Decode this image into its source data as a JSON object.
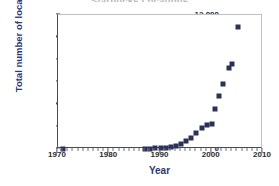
{
  "chart_data": {
    "type": "scatter",
    "title": "Starbucks Locations",
    "xlabel": "Year",
    "ylabel": "Total number of locations",
    "xlim": [
      1970,
      2010
    ],
    "ylim": [
      0,
      12000
    ],
    "grid": false,
    "legend": null,
    "marker": {
      "shape": "square",
      "color": "#2b3158",
      "size": 5
    },
    "xticks": [
      1970,
      1980,
      1990,
      2000,
      2010
    ],
    "xtick_labels": [
      "1970",
      "1980",
      "1990",
      "2000",
      "2010"
    ],
    "xtick_minor_step": 1,
    "yticks": [
      0,
      2000,
      4000,
      6000,
      8000,
      10000,
      12000
    ],
    "ytick_labels": [
      "0",
      "2000",
      "4000",
      "6000",
      "8000",
      "10,000",
      "12,000"
    ],
    "x": [
      1971,
      1987,
      1988,
      1989,
      1990,
      1991,
      1992,
      1993,
      1994,
      1995,
      1996,
      1997,
      1998,
      1999,
      2000,
      2001,
      2002,
      2003,
      2004,
      2005
    ],
    "values": [
      1,
      17,
      33,
      55,
      84,
      116,
      165,
      272,
      425,
      677,
      1015,
      1412,
      1886,
      2135,
      2250,
      3500,
      4750,
      5800,
      7250,
      7650
    ],
    "points": [
      {
        "x": 1971,
        "y": 1
      },
      {
        "x": 1987,
        "y": 17
      },
      {
        "x": 1988,
        "y": 33
      },
      {
        "x": 1989,
        "y": 55
      },
      {
        "x": 1990,
        "y": 84
      },
      {
        "x": 1991,
        "y": 116
      },
      {
        "x": 1992,
        "y": 165
      },
      {
        "x": 1993,
        "y": 272
      },
      {
        "x": 1994,
        "y": 425
      },
      {
        "x": 1995,
        "y": 677
      },
      {
        "x": 1996,
        "y": 1015
      },
      {
        "x": 1997,
        "y": 1412
      },
      {
        "x": 1998,
        "y": 1886
      },
      {
        "x": 1999,
        "y": 2135
      },
      {
        "x": 2000,
        "y": 2250
      },
      {
        "x": 2000.6,
        "y": 3550
      },
      {
        "x": 2001.4,
        "y": 4750
      },
      {
        "x": 2002.2,
        "y": 5800
      },
      {
        "x": 2003.3,
        "y": 7250
      },
      {
        "x": 2003.9,
        "y": 7650
      },
      {
        "x": 2005.2,
        "y": 10900
      }
    ]
  },
  "colors": {
    "marker": "#2b3158",
    "axis_title": "#283a72",
    "tick_label": "#2a2a30",
    "axis_line": "#4a4a52",
    "background": "#ffffff"
  }
}
